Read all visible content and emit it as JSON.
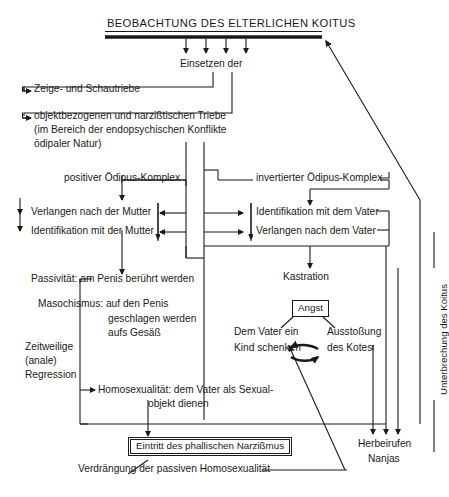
{
  "diagram": {
    "title": "BEOBACHTUNG DES ELTERLICHEN KOITUS",
    "subtitle": "Einsetzen der",
    "branch_a": "Zeige- und Schautriebe",
    "branch_b_line1": "objektbezogenen und narzißtischen Triebe",
    "branch_b_line2": "(im Bereich der endopsychischen Konflikte",
    "branch_b_line3": "ödipaler Natur)",
    "oedipus_positive": "positiver Ödipus-Komplex",
    "oedipus_inverted": "invertierter Ödipus-Komplex",
    "mother_desire": "Verlangen nach der Mutter",
    "mother_identification": "Identifikation mit der Mutter",
    "father_identification": "Identifikation mit dem Vater",
    "father_desire": "Verlangen nach dem Vater",
    "passivity": "Passivität: am Penis berührt werden",
    "masochism_line1": "Masochismus: auf den Penis",
    "masochism_line2": "geschlagen werden",
    "masochism_line3": "aufs Gesäß",
    "regression_line1": "Zeitweilige",
    "regression_line2": "(anale)",
    "regression_line3": "Regression",
    "homosexuality_line1": "Homosexualität: dem Vater als Sexual-",
    "homosexuality_line2": "objekt dienen",
    "castration": "Kastration",
    "angst": "Angst",
    "gift_line1": "Dem Vater ein",
    "gift_line2": "Kind schenken",
    "expulsion_line1": "Ausstoßung",
    "expulsion_line2": "des Kotes",
    "phallic_narcissism": "Eintritt des phallischen Narzißmus",
    "repression": "Verdrängung der passiven Homosexualität",
    "summon_line1": "Herbeirufen",
    "summon_line2": "Nanjas",
    "coitus_interruption": "Unterbrechung des Koitus",
    "colors": {
      "ink": "#1a1a1a",
      "background": "#ffffff"
    }
  }
}
